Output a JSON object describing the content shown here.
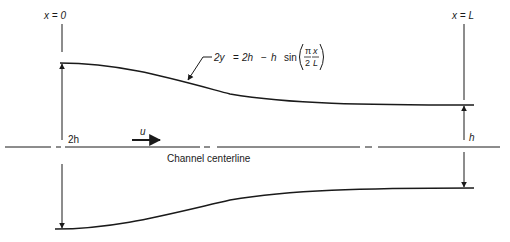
{
  "diagram": {
    "labels": {
      "x_start": "x = 0",
      "x_end": "x = L",
      "inlet_height": "2h",
      "outlet_half_height": "h",
      "velocity": "u",
      "centerline": "Channel centerline"
    },
    "equation": {
      "lhs": "2y",
      "eq": "=",
      "term1": "2h",
      "minus": "−",
      "term2": "h",
      "func": "sin",
      "frac1_num": "π",
      "frac1_den": "2",
      "frac2_num": "x",
      "frac2_den": "L"
    },
    "colors": {
      "line": "#1a1a1a",
      "background": "#ffffff"
    }
  }
}
